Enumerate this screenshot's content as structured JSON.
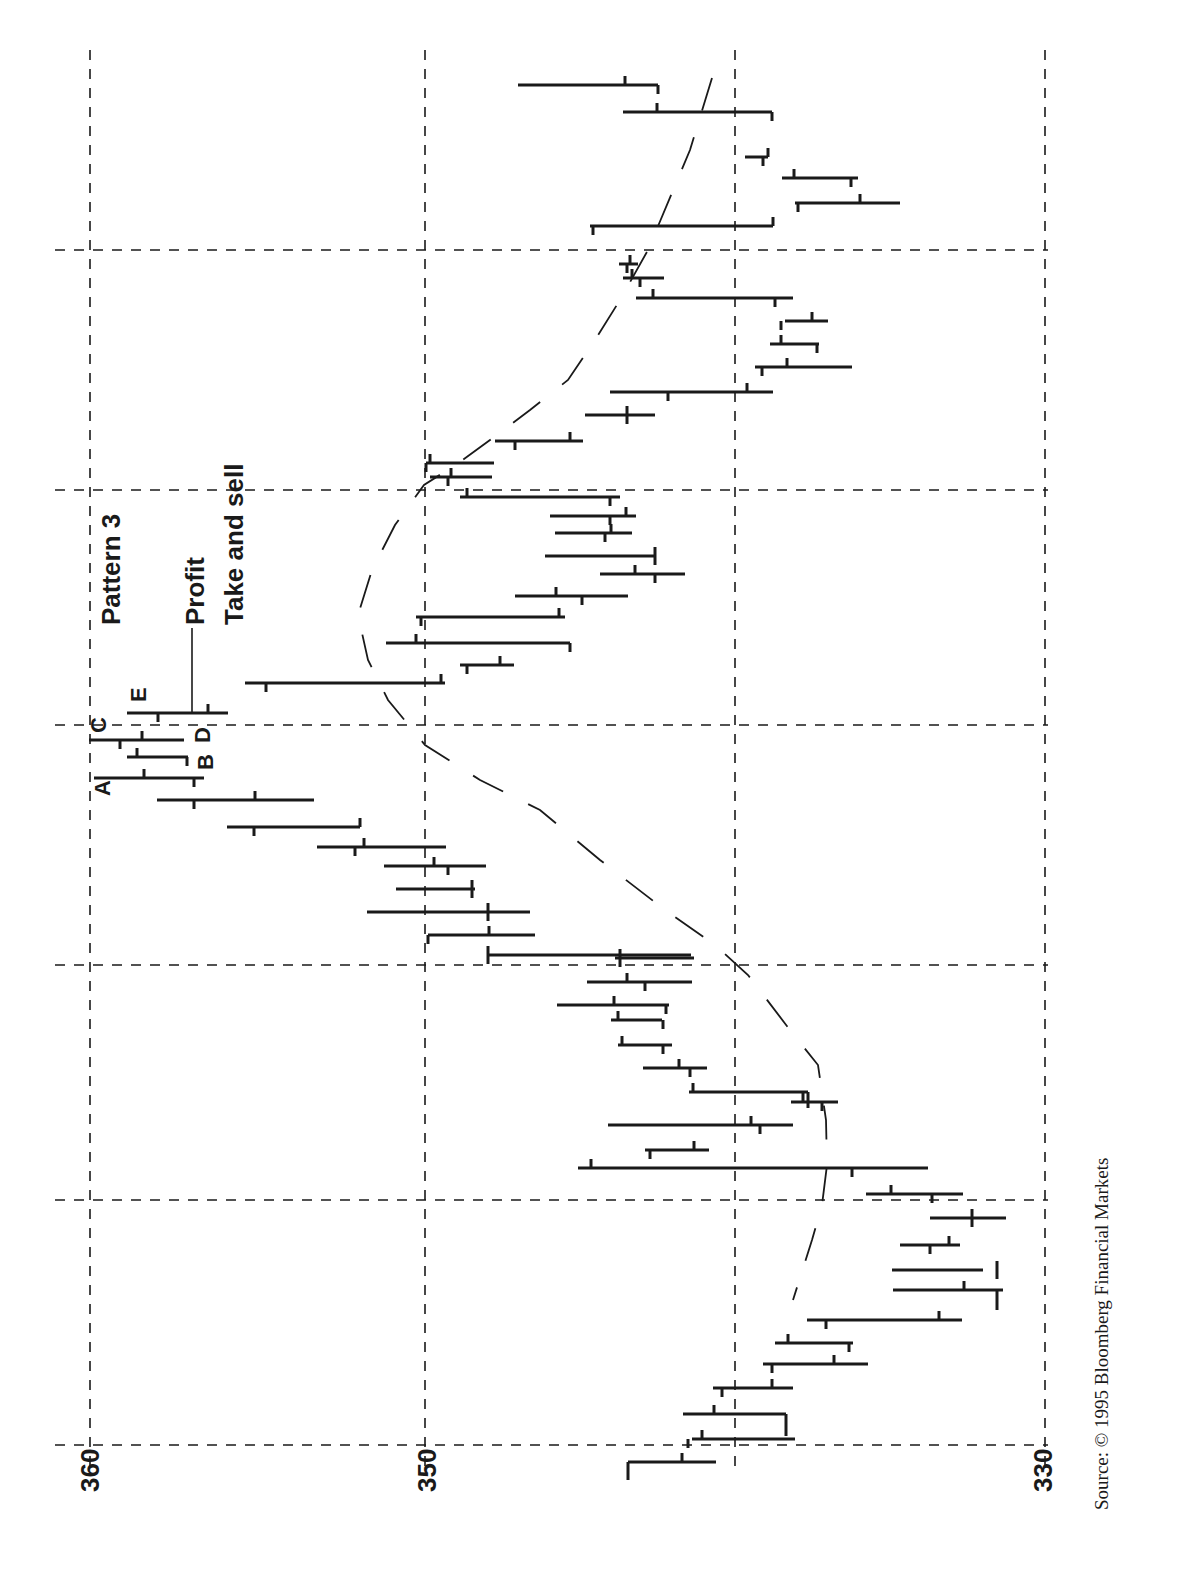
{
  "chart_data": {
    "type": "bar",
    "subtype": "ohlc",
    "orientation": "rotated-90-ccw (price axis horizontal, time runs bottom to top)",
    "title": "",
    "annotations": {
      "pattern": "Pattern 3",
      "profit_line1": "Profit",
      "profit_line2": "Take and sell",
      "letters": [
        "A",
        "B",
        "C",
        "D",
        "E"
      ]
    },
    "price_axis": {
      "ticks": [
        360,
        350,
        330
      ],
      "range": [
        330,
        360
      ],
      "grid_values": [
        360,
        350,
        340,
        330
      ]
    },
    "grid": true,
    "moving_average": "dashed curve overlay",
    "source": "Source: © 1995 Bloomberg Financial Markets",
    "bars_note": "Each bar listed oldest to newest: high, low, open, close (prices, approximate)",
    "bars": [
      {
        "high": 346.1,
        "low": 343.4,
        "open": 344.5,
        "close": 346.1
      },
      {
        "high": 344.6,
        "low": 343.9,
        "open": 344.4,
        "close": 344.5
      },
      {
        "high": 343.8,
        "low": 342.0,
        "open": 343.6,
        "close": 342.0
      },
      {
        "high": 343.9,
        "low": 342.0,
        "open": 343.3,
        "close": 343.6
      },
      {
        "high": 342.8,
        "low": 342.0,
        "open": 342.8,
        "close": 342.5
      },
      {
        "high": 343.2,
        "low": 341.6,
        "open": 342.5,
        "close": 342.6
      },
      {
        "high": 343.7,
        "low": 342.1,
        "open": 342.5,
        "close": 341.7
      },
      {
        "high": 341.4,
        "low": 339.8,
        "open": 341.5,
        "close": 340.5
      },
      {
        "high": 339.6,
        "low": 337.9,
        "open": 339.5,
        "close": 339.0
      },
      {
        "high": 339.8,
        "low": 338.0,
        "open": 338.2,
        "close": 338.7
      },
      {
        "high": 342.7,
        "low": 338.1,
        "open": 339.1,
        "close": 339.1
      },
      {
        "high": 339.2,
        "low": 335.8,
        "open": 339.2,
        "close": 336.1
      },
      {
        "high": 338.2,
        "low": 335.5,
        "open": 336.9,
        "close": 335.7
      },
      {
        "high": 338.2,
        "low": 336.2,
        "open": 337.0,
        "close": 336.2
      },
      {
        "high": 336.1,
        "low": 334.0,
        "open": 335.2,
        "close": 334.0
      },
      {
        "high": 336.3,
        "low": 333.7,
        "open": 334.0,
        "close": 334.9
      },
      {
        "high": 334.0,
        "low": 331.7,
        "open": 332.2,
        "close": 331.4
      },
      {
        "high": 334.8,
        "low": 333.1,
        "open": 334.5,
        "close": 333.3
      },
      {
        "high": 335.2,
        "low": 332.1,
        "open": 333.2,
        "close": 332.7
      },
      {
        "high": 334.3,
        "low": 331.8,
        "open": 333.5,
        "close": 331.8
      },
      {
        "high": 336.7,
        "low": 333.7,
        "open": 333.6,
        "close": 334.9
      },
      {
        "high": 336.8,
        "low": 335.3,
        "open": 336.0,
        "close": 335.0
      },
      {
        "high": 336.9,
        "low": 333.0,
        "open": 336.6,
        "close": 336.5
      },
      {
        "high": 337.4,
        "low": 337.0,
        "open": 336.9,
        "close": 338.9
      },
      {
        "high": 340.3,
        "low": 336.7,
        "open": 338.9,
        "close": 338.7
      },
      {
        "high": 339.5,
        "low": 338.1,
        "open": 338.3,
        "close": 338.8
      },
      {
        "high": 340.2,
        "low": 338.6,
        "open": 339.5,
        "close": 339.4
      },
      {
        "high": 340.6,
        "low": 338.5,
        "open": 339.8,
        "close": 339.4
      },
      {
        "high": 340.4,
        "low": 339.1,
        "open": 339.9,
        "close": 339.2
      },
      {
        "high": 340.7,
        "low": 337.9,
        "open": 339.6,
        "close": 340.7
      },
      {
        "high": 347.6,
        "low": 339.2,
        "open": 339.3,
        "close": 346.1
      },
      {
        "high": 350.1,
        "low": 346.9,
        "open": 346.1,
        "close": 347.6
      },
      {
        "high": 351.2,
        "low": 347.9,
        "open": 346.1,
        "close": 351.2
      },
      {
        "high": 350.0,
        "low": 348.2,
        "open": 348.3,
        "close": 348.2
      },
      {
        "high": 350.8,
        "low": 348.0,
        "open": 348.9,
        "close": 349.2
      },
      {
        "high": 351.3,
        "low": 349.0,
        "open": 350.9,
        "close": 351.4
      },
      {
        "high": 352.9,
        "low": 350.2,
        "open": 352.4,
        "close": 352.6
      },
      {
        "high": 355.2,
        "low": 352.3,
        "open": 355.2,
        "close": 352.6
      },
      {
        "high": 356.7,
        "low": 353.9,
        "open": 357.0,
        "close": 357.0
      },
      {
        "high": 359.9,
        "low": 356.0,
        "open": 358.6,
        "close": 357.0
      },
      {
        "high": 358.4,
        "low": 357.0,
        "open": 358.1,
        "close": 357.4
      },
      {
        "high": 359.9,
        "low": 357.3,
        "open": 358.2,
        "close": 358.9
      },
      {
        "high": 358.1,
        "low": 356.3,
        "open": 357.6,
        "close": 357.6
      },
      {
        "high": 354.7,
        "low": 350.7,
        "open": 354.4,
        "close": 350.4
      },
      {
        "high": 349.4,
        "low": 348.6,
        "open": 348.9,
        "close": 349.0
      },
      {
        "high": 351.1,
        "low": 346.1,
        "open": 350.3,
        "close": 350.4
      },
      {
        "high": 350.9,
        "low": 346.8,
        "open": 346.9,
        "close": 350.6
      },
      {
        "high": 348.0,
        "low": 344.1,
        "open": 345.7,
        "close": 346.2
      },
      {
        "high": 346.1,
        "low": 341.7,
        "open": 343.9,
        "close": 341.9
      },
      {
        "high": 343.9,
        "low": 341.9,
        "open": 342.3,
        "close": 343.9
      },
      {
        "high": 345.4,
        "low": 342.5,
        "open": 343.3,
        "close": 345.4
      },
      {
        "high": 345.5,
        "low": 343.7,
        "open": 343.9,
        "close": 344.3
      },
      {
        "high": 345.9,
        "low": 343.4,
        "open": 344.2,
        "close": 344.4
      },
      {
        "high": 348.9,
        "low": 344.4,
        "open": 348.1,
        "close": 344.4
      },
      {
        "high": 348.6,
        "low": 346.4,
        "open": 348.0,
        "close": 348.5
      },
      {
        "high": 347.2,
        "low": 345.0,
        "open": 346.8,
        "close": 345.4
      },
      {
        "high": 348.0,
        "low": 346.0,
        "open": 346.1,
        "close": 348.0
      },
      {
        "high": 345.3,
        "low": 341.2,
        "open": 344.2,
        "close": 339.8
      },
      {
        "high": 339.7,
        "low": 339.4,
        "open": 338.8,
        "close": 338.0
      },
      {
        "high": 338.3,
        "low": 336.8,
        "open": 337.0,
        "close": 336.3
      },
      {
        "high": 338.1,
        "low": 335.5,
        "open": 336.4,
        "close": 335.3
      },
      {
        "high": 339.0,
        "low": 337.4,
        "open": 337.1,
        "close": 338.0
      },
      {
        "high": 338.8,
        "low": 336.6,
        "open": 337.5,
        "close": 337.1
      },
      {
        "high": 336.8,
        "low": 336.0,
        "open": 337.0,
        "close": 336.3
      },
      {
        "high": 346.0,
        "low": 337.6,
        "open": 341.5,
        "close": 337.6
      },
      {
        "high": 342.1,
        "low": 338.6,
        "open": 343.0,
        "close": 343.6
      },
      {
        "high": 341.5,
        "low": 337.7,
        "open": 341.0,
        "close": 338.0
      },
      {
        "high": 335.8,
        "low": 335.5,
        "open": 336.1,
        "close": 335.5
      },
      {
        "high": 342.0,
        "low": 337.1,
        "open": 341.1,
        "close": 342.0
      },
      {
        "high": 344.8,
        "low": 341.5,
        "open": 344.8,
        "close": 344.3
      }
    ]
  },
  "axis": {
    "label_360": "360",
    "label_350": "350",
    "label_330": "330"
  },
  "labels": {
    "pattern": "Pattern 3",
    "profit": "Profit",
    "take_and_sell": "Take and sell",
    "a": "A",
    "b": "B",
    "c": "C",
    "d": "D",
    "e": "E"
  },
  "source": "Source: © 1995 Bloomberg Financial Markets",
  "render": {
    "grid_x": [
      90,
      425,
      735,
      1045
    ],
    "grid_y": [
      250,
      490,
      725,
      965,
      1200,
      1445
    ],
    "segments": [
      {
        "y": 1462,
        "x1": 628,
        "x2": 716,
        "up": 682,
        "down": 628,
        "downLen": 18
      },
      {
        "y": 1439,
        "x1": 692,
        "x2": 795,
        "up": 702,
        "down": 688
      },
      {
        "y": 1414,
        "x1": 683,
        "x2": 786,
        "up": 714,
        "down": 786,
        "downLen": 22
      },
      {
        "y": 1388,
        "x1": 713,
        "x2": 793,
        "up": 772,
        "down": 722
      },
      {
        "y": 1364,
        "x1": 763,
        "x2": 868,
        "up": 834,
        "down": 772
      },
      {
        "y": 1343,
        "x1": 775,
        "x2": 853,
        "up": 788,
        "down": 849
      },
      {
        "y": 1320,
        "x1": 807,
        "x2": 962,
        "up": 939,
        "down": 826
      },
      {
        "y": 1290,
        "x1": 893,
        "x2": 1003,
        "up": 964,
        "down": 997,
        "downLen": 20
      },
      {
        "y": 1270,
        "x1": 892,
        "x2": 983,
        "up": 997,
        "down": 997
      },
      {
        "y": 1245,
        "x1": 900,
        "x2": 960,
        "up": 949,
        "down": 930
      },
      {
        "y": 1218,
        "x1": 930,
        "x2": 1006,
        "up": 972,
        "down": 972
      },
      {
        "y": 1194,
        "x1": 866,
        "x2": 963,
        "up": 891,
        "down": 932
      },
      {
        "y": 1168,
        "x1": 578,
        "x2": 928,
        "up": 591,
        "down": 852
      },
      {
        "y": 1150,
        "x1": 645,
        "x2": 709,
        "up": 694,
        "down": 650
      },
      {
        "y": 1125,
        "x1": 608,
        "x2": 793,
        "up": 751,
        "down": 760
      },
      {
        "y": 1102,
        "x1": 791,
        "x2": 838,
        "up": 803,
        "down": 822
      },
      {
        "y": 1092,
        "x1": 689,
        "x2": 808,
        "up": 693,
        "down": 808,
        "downLen": 16
      },
      {
        "y": 1068,
        "x1": 643,
        "x2": 707,
        "up": 679,
        "down": 690
      },
      {
        "y": 1045,
        "x1": 618,
        "x2": 672,
        "up": 622,
        "down": 663
      },
      {
        "y": 1020,
        "x1": 611,
        "x2": 662,
        "up": 618,
        "down": 663
      },
      {
        "y": 1005,
        "x1": 557,
        "x2": 669,
        "up": 614,
        "down": 666
      },
      {
        "y": 982,
        "x1": 587,
        "x2": 692,
        "up": 627,
        "down": 645
      },
      {
        "y": 958,
        "x1": 615,
        "x2": 694,
        "up": 620,
        "down": 620
      },
      {
        "y": 955,
        "x1": 488,
        "x2": 691,
        "up": 488,
        "down": 488
      },
      {
        "y": 935,
        "x1": 428,
        "x2": 535,
        "up": 489,
        "down": 428
      },
      {
        "y": 912,
        "x1": 367,
        "x2": 530,
        "up": 488,
        "down": 488
      },
      {
        "y": 889,
        "x1": 396,
        "x2": 475,
        "up": 472,
        "down": 472
      },
      {
        "y": 866,
        "x1": 384,
        "x2": 486,
        "up": 434,
        "down": 448
      },
      {
        "y": 847,
        "x1": 317,
        "x2": 446,
        "up": 364,
        "down": 355
      },
      {
        "y": 827,
        "x1": 227,
        "x2": 360,
        "up": 360,
        "down": 254
      },
      {
        "y": 800,
        "x1": 157,
        "x2": 314,
        "up": 255,
        "down": 194
      },
      {
        "y": 778,
        "x1": 94,
        "x2": 204,
        "up": 144,
        "down": 194
      },
      {
        "y": 757,
        "x1": 127,
        "x2": 188,
        "up": 137,
        "down": 187
      },
      {
        "y": 740,
        "x1": 89,
        "x2": 184,
        "up": 142,
        "down": 120
      },
      {
        "y": 713,
        "x1": 127,
        "x2": 228,
        "up": 208,
        "down": 158
      },
      {
        "y": 683,
        "x1": 245,
        "x2": 445,
        "up": 441,
        "down": 266
      },
      {
        "y": 665,
        "x1": 460,
        "x2": 514,
        "up": 500,
        "down": 467
      },
      {
        "y": 643,
        "x1": 386,
        "x2": 570,
        "up": 416,
        "down": 570
      },
      {
        "y": 617,
        "x1": 416,
        "x2": 565,
        "up": 559,
        "down": 421
      },
      {
        "y": 596,
        "x1": 515,
        "x2": 628,
        "up": 556,
        "down": 582
      },
      {
        "y": 574,
        "x1": 600,
        "x2": 685,
        "up": 635,
        "down": 655
      },
      {
        "y": 556,
        "x1": 545,
        "x2": 655,
        "up": 655,
        "down": 655
      },
      {
        "y": 533,
        "x1": 555,
        "x2": 632,
        "up": 611,
        "down": 605
      },
      {
        "y": 516,
        "x1": 550,
        "x2": 636,
        "up": 626,
        "down": 610
      },
      {
        "y": 497,
        "x1": 460,
        "x2": 620,
        "up": 467,
        "down": 610
      },
      {
        "y": 477,
        "x1": 430,
        "x2": 492,
        "up": 451,
        "down": 448
      },
      {
        "y": 463,
        "x1": 426,
        "x2": 494,
        "up": 430,
        "down": 426
      },
      {
        "y": 441,
        "x1": 495,
        "x2": 583,
        "up": 570,
        "down": 515
      },
      {
        "y": 415,
        "x1": 585,
        "x2": 655,
        "up": 627,
        "down": 627
      },
      {
        "y": 392,
        "x1": 610,
        "x2": 773,
        "up": 747,
        "down": 668
      },
      {
        "y": 367,
        "x1": 755,
        "x2": 852,
        "up": 787,
        "down": 762
      },
      {
        "y": 344,
        "x1": 770,
        "x2": 819,
        "up": 781,
        "down": 817
      },
      {
        "y": 321,
        "x1": 785,
        "x2": 828,
        "up": 812,
        "down": 781
      },
      {
        "y": 298,
        "x1": 636,
        "x2": 793,
        "up": 653,
        "down": 775
      },
      {
        "y": 278,
        "x1": 623,
        "x2": 664,
        "up": 632,
        "down": 640
      },
      {
        "y": 264,
        "x1": 619,
        "x2": 638,
        "up": 630,
        "down": 627
      },
      {
        "y": 226,
        "x1": 590,
        "x2": 773,
        "up": 773,
        "down": 593
      },
      {
        "y": 203,
        "x1": 795,
        "x2": 900,
        "up": 860,
        "down": 798
      },
      {
        "y": 178,
        "x1": 782,
        "x2": 858,
        "up": 794,
        "down": 851
      },
      {
        "y": 157,
        "x1": 745,
        "x2": 768,
        "up": 768,
        "down": 763
      },
      {
        "y": 112,
        "x1": 623,
        "x2": 772,
        "up": 657,
        "down": 772
      },
      {
        "y": 85,
        "x1": 518,
        "x2": 658,
        "up": 625,
        "down": 658
      }
    ],
    "ma_path": "M 712 78 L 690 150 L 648 250 L 620 300 L 595 340 L 568 380 L 530 410 L 490 440 L 460 462 L 424 485 L 395 525 L 372 570 L 358 615 L 368 660 L 388 700 L 425 745 L 480 780 L 540 810 L 600 860 L 665 910 L 715 945 L 748 975 L 790 1030 L 818 1065 L 826 1120 L 827 1165 L 822 1205 L 812 1240 L 793 1300"
  }
}
